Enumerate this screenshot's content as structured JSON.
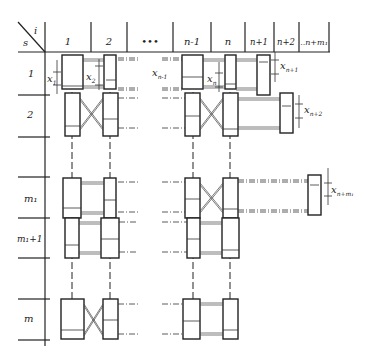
{
  "header": {
    "corner_top": "i",
    "corner_bottom": "s",
    "columns": [
      "1",
      "2",
      "•••",
      "n-1",
      "n",
      "n+1",
      "n+2",
      "..n+m₁"
    ]
  },
  "rows": [
    "1",
    "2",
    "m₁",
    "m₁+1",
    "m"
  ],
  "displacements": {
    "x1": {
      "base": "x",
      "sub": "1"
    },
    "x2": {
      "base": "x",
      "sub": "2"
    },
    "xn_1": {
      "base": "x",
      "sub": "n-1"
    },
    "xn": {
      "base": "x",
      "sub": "n"
    },
    "xn1": {
      "base": "x",
      "sub": "n+1"
    },
    "xn2": {
      "base": "x",
      "sub": "n+2"
    },
    "xnm": {
      "base": "x",
      "sub": "n+m₁"
    }
  }
}
